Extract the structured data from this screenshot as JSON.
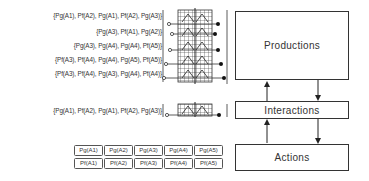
{
  "diagram": {
    "sets": [
      {
        "label_parts": [
          "{P",
          "g",
          "(A",
          "1",
          "), P",
          "f",
          "(A",
          "2",
          "), P",
          "g",
          "(A",
          "1",
          "), P",
          "f",
          "(A",
          "2",
          "), P",
          "g",
          "(A",
          "3",
          ")}"
        ],
        "text": "{Pg(A1), Pf(A2), Pg(A1), Pf(A2), Pg(A3)}"
      },
      {
        "text": "{Pg(A3), Pf(A1), Pg(A2)}"
      },
      {
        "text": "{Pg(A3), Pg(A4), Pg(A4), Pf(A5)}"
      },
      {
        "text": "{Pf(A3), Pf(A4), Pg(A4), Pg(A5), Pf(A5)}"
      },
      {
        "text": "{Pf(A3), Pf(A4), Pg(A3), Pg(A4), Pf(A4)}"
      },
      {
        "text": "{Pg(A1), Pf(A2), Pg(A1), Pf(A2), Pg(A3)}"
      }
    ],
    "cells_row1": [
      "Pg(A1)",
      "Pg(A2)",
      "Pg(A3)",
      "Pg(A4)",
      "Pg(A5)"
    ],
    "cells_row2": [
      "Pf(A1)",
      "Pf(A2)",
      "Pf(A3)",
      "Pf(A4)",
      "Pf(A5)"
    ],
    "boxes": {
      "productions": "Productions",
      "interactions": "Interactions",
      "actions": "Actions"
    },
    "colors": {
      "line": "#333333",
      "text": "#333333",
      "background": "#ffffff"
    }
  }
}
